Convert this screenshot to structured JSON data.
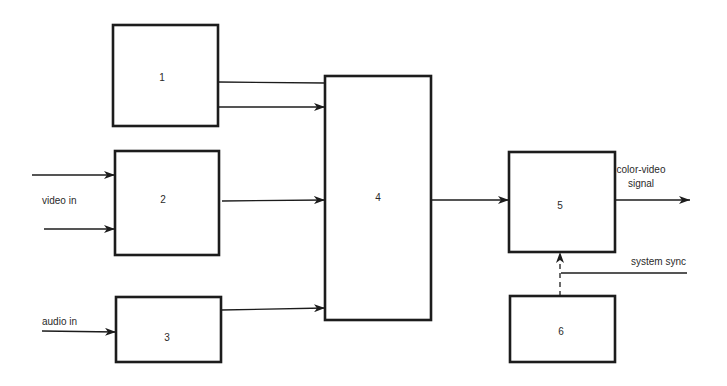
{
  "diagram": {
    "type": "block-diagram",
    "blocks": [
      {
        "id": "1",
        "label": "1"
      },
      {
        "id": "2",
        "label": "2"
      },
      {
        "id": "3",
        "label": "3"
      },
      {
        "id": "4",
        "label": "4"
      },
      {
        "id": "5",
        "label": "5"
      },
      {
        "id": "6",
        "label": "6"
      }
    ],
    "labels": {
      "video_in": "video in",
      "audio_in": "audio in",
      "output_line1": "color-video",
      "output_line2": "signal",
      "system_sync": "system sync"
    },
    "connections": [
      {
        "from": "1",
        "to": "4",
        "arrow": false
      },
      {
        "from": "1",
        "to": "4",
        "arrow": true
      },
      {
        "from": "video in",
        "to": "2",
        "arrow": true
      },
      {
        "from": "video in",
        "to": "2",
        "arrow": true
      },
      {
        "from": "2",
        "to": "4",
        "arrow": true
      },
      {
        "from": "audio in",
        "to": "3",
        "arrow": true
      },
      {
        "from": "3",
        "to": "4",
        "arrow": true
      },
      {
        "from": "4",
        "to": "5",
        "arrow": true
      },
      {
        "from": "5",
        "to": "color-video signal",
        "arrow": true
      },
      {
        "from": "6",
        "to": "5",
        "arrow": true,
        "style": "dashed"
      },
      {
        "from": "system sync",
        "to": "6-5 link",
        "arrow": false
      }
    ]
  }
}
